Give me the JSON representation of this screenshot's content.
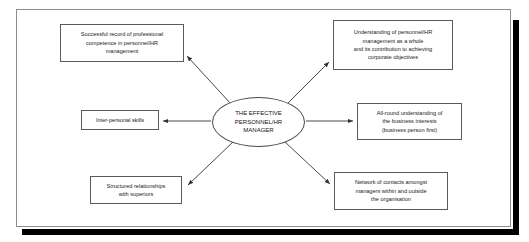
{
  "figure": {
    "title": "The Effective Personnel/HR Manager",
    "center": {
      "label": "THE EFFECTIVE\nPERSONNEL/HR\nMANAGER"
    },
    "nodes": [
      {
        "id": "success",
        "label": "Successful record of professional\ncompetence in personnel/HR\nmanagement",
        "position": "top-left",
        "arrow_direction": "from-center-to-node"
      },
      {
        "id": "interpersonal",
        "label": "Inter-personal skills",
        "position": "middle-left",
        "arrow_direction": "from-center-to-node"
      },
      {
        "id": "structured",
        "label": "Structured relationships\nwith superiors",
        "position": "bottom-left",
        "arrow_direction": "from-center-to-node"
      },
      {
        "id": "understanding",
        "label": "Understanding of personnel/HR\nmanagement as a whole\nand its contribution to achieving\ncorporate objectives",
        "position": "top-right",
        "arrow_direction": "from-center-to-node"
      },
      {
        "id": "allround",
        "label": "All-round understanding of\nthe business interests\n(business person first)",
        "position": "middle-right",
        "arrow_direction": "from-center-to-node"
      },
      {
        "id": "network",
        "label": "Network of contacts amongst\nmanagers within and outside\nthe organisation",
        "position": "bottom-right",
        "arrow_direction": "from-center-to-node"
      }
    ],
    "colors": {
      "page_background": "#ffffff",
      "frame_border": "#8d8d8d",
      "box_border": "#5a5a5a",
      "ellipse_border": "#4a4a4a",
      "connector": "#333333",
      "shadow": "#000000",
      "text": "#1a1a1a"
    }
  }
}
